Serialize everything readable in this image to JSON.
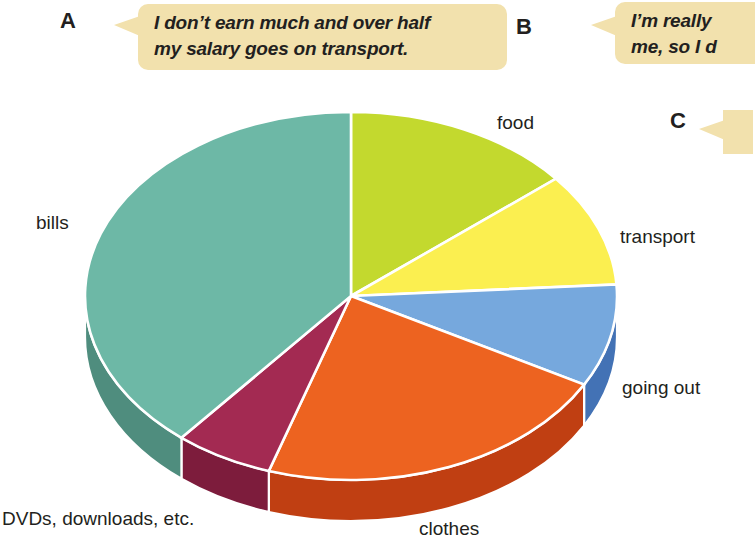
{
  "page": {
    "width": 735,
    "height": 544,
    "background": "#ffffff"
  },
  "callouts": [
    {
      "marker": "A",
      "text": "I don’t earn much and over half\nmy salary goes on transport.",
      "bubble_color": "#f2e1ad",
      "text_color": "#231f20"
    },
    {
      "marker": "B",
      "text": "I’m really\nme, so I d",
      "bubble_color": "#f2e1ad",
      "text_color": "#231f20"
    },
    {
      "marker": "C",
      "text": "",
      "bubble_color": "#f2e1ad",
      "text_color": "#231f20"
    }
  ],
  "chart_data": {
    "type": "pie",
    "title": "",
    "subtitle": "",
    "xlabel": "",
    "ylabel": "",
    "style": "3d-exploded-ellipse",
    "legend_position": "labels-around-slices",
    "grid": false,
    "categories": [
      "food",
      "transport",
      "going out",
      "clothes",
      "DVDs, downloads, etc.",
      "bills"
    ],
    "values": [
      14,
      10,
      9,
      22,
      6,
      39
    ],
    "colors": [
      "#c3d92e",
      "#fbef50",
      "#76a8dd",
      "#ed6320",
      "#a32a52",
      "#6db8a6"
    ],
    "side_colors": [
      "#9cb024",
      "#cbbd3f",
      "#4372b5",
      "#c03f12",
      "#7d1c3c",
      "#4f8d7e"
    ],
    "slice_boundaries_deg": [
      0,
      50,
      86,
      118,
      200,
      222,
      360
    ],
    "slices": [
      {
        "label": "food",
        "value": 14,
        "color": "#c3d92e",
        "side_color": "#9cb024"
      },
      {
        "label": "transport",
        "value": 10,
        "color": "#fbef50",
        "side_color": "#cbbd3f"
      },
      {
        "label": "going out",
        "value": 9,
        "color": "#76a8dd",
        "side_color": "#4372b5"
      },
      {
        "label": "clothes",
        "value": 22,
        "color": "#ed6320",
        "side_color": "#c03f12"
      },
      {
        "label": "DVDs, downloads, etc.",
        "value": 6,
        "color": "#a32a52",
        "side_color": "#7d1c3c"
      },
      {
        "label": "bills",
        "value": 39,
        "color": "#6db8a6",
        "side_color": "#4f8d7e"
      }
    ],
    "labels": {
      "food": "food",
      "transport": "transport",
      "going_out": "going out",
      "clothes": "clothes",
      "dvds": "DVDs, downloads, etc.",
      "bills": "bills"
    }
  }
}
